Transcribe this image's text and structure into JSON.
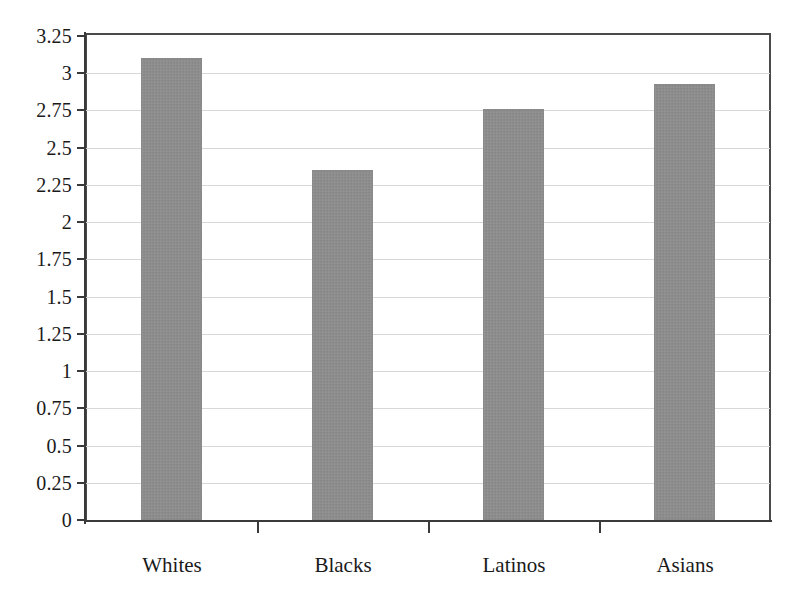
{
  "chart_data": {
    "type": "bar",
    "title": "",
    "subtitle": "",
    "xlabel": "",
    "ylabel": "",
    "categories": [
      "Whites",
      "Blacks",
      "Latinos",
      "Asians"
    ],
    "values": [
      3.1,
      2.35,
      2.76,
      2.93
    ],
    "series": [
      {
        "name": "",
        "values": [
          3.1,
          2.35,
          2.76,
          2.93
        ]
      }
    ],
    "ylim": [
      0,
      3.25
    ],
    "ytick_step": 0.25,
    "ytick_labels": [
      "3.25",
      "3",
      "2.75",
      "2.5",
      "2.25",
      "2",
      "1.75",
      "1.5",
      "1.25",
      "1",
      "0.75",
      "0.5",
      "0.25",
      "0"
    ],
    "ytick_values": [
      3.25,
      3,
      2.75,
      2.5,
      2.25,
      2,
      1.75,
      1.5,
      1.25,
      1,
      0.75,
      0.5,
      0.25,
      0
    ],
    "grid": true,
    "grid_axis": "y",
    "legend": false,
    "legend_position": "none",
    "annotations": [],
    "colors": {
      "bar_fill": "#8c8c8c",
      "axis": "#3a3a3a",
      "gridline": "#d8d8d8",
      "text": "#1a1a1a",
      "background": "#ffffff"
    }
  }
}
